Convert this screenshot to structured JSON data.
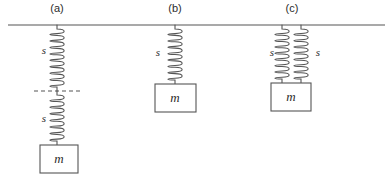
{
  "figure": {
    "stroke_color": "#555555",
    "text_color": "#2b2b2b",
    "background": "#ffffff",
    "ceiling": {
      "label": "ceiling-support-line",
      "x1": 8,
      "x2": 385,
      "y": 25
    },
    "reference_line": {
      "label": "dashed-reference-line",
      "x1": 34,
      "x2": 80,
      "y": 91,
      "dash": "4 3"
    }
  },
  "panels": [
    {
      "id": "a",
      "label": "(a)",
      "label_x": 57,
      "label_y": 2,
      "description": "two springs in series",
      "springs": [
        {
          "name": "upper-spring",
          "label": "s",
          "label_x": 44,
          "label_y": 50,
          "cx": 57,
          "y_top": 25,
          "y_bottom": 91,
          "coils": 9,
          "radius": 5
        },
        {
          "name": "lower-spring",
          "label": "s",
          "label_x": 44,
          "label_y": 118,
          "cx": 57,
          "y_top": 91,
          "y_bottom": 145,
          "coils": 7,
          "radius": 5
        }
      ],
      "mass": {
        "label": "m",
        "x": 40,
        "y": 145,
        "width": 38,
        "height": 28,
        "cx": 59,
        "cy": 159
      }
    },
    {
      "id": "b",
      "label": "(b)",
      "label_x": 175,
      "label_y": 2,
      "description": "single spring",
      "springs": [
        {
          "name": "single-spring",
          "label": "s",
          "label_x": 158,
          "label_y": 52,
          "cx": 175,
          "y_top": 25,
          "y_bottom": 84,
          "coils": 8,
          "radius": 5
        }
      ],
      "mass": {
        "label": "m",
        "x": 155,
        "y": 84,
        "width": 41,
        "height": 28,
        "cx": 175,
        "cy": 98
      }
    },
    {
      "id": "c",
      "label": "(c)",
      "label_x": 292,
      "label_y": 2,
      "description": "two springs in parallel",
      "springs": [
        {
          "name": "left-spring",
          "label": "s",
          "label_x": 272,
          "label_y": 52,
          "cx": 282,
          "y_top": 25,
          "y_bottom": 83,
          "coils": 8,
          "radius": 5
        },
        {
          "name": "right-spring",
          "label": "s",
          "label_x": 318,
          "label_y": 52,
          "cx": 301,
          "y_top": 25,
          "y_bottom": 83,
          "coils": 8,
          "radius": 5
        }
      ],
      "mass": {
        "label": "m",
        "x": 271,
        "y": 83,
        "width": 40,
        "height": 28,
        "cx": 291,
        "cy": 97
      }
    }
  ]
}
